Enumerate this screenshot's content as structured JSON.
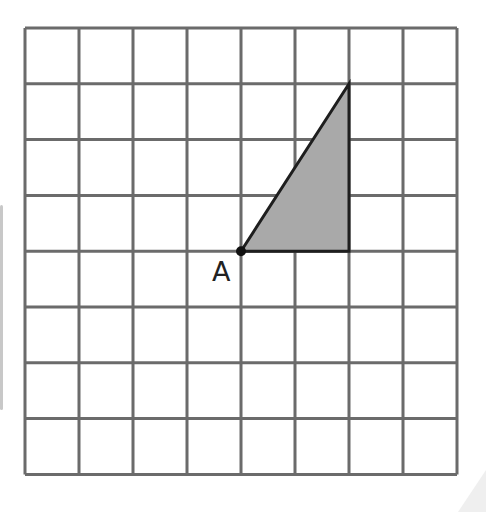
{
  "diagram": {
    "type": "grid-with-triangle",
    "grid": {
      "columns": 8,
      "rows": 8,
      "origin_px": [
        25,
        28
      ],
      "cell_width_px": 54,
      "cell_height_px": 55.8,
      "line_color": "#6b6b6b",
      "line_width": 3
    },
    "triangle": {
      "vertices_grid": [
        [
          4,
          4
        ],
        [
          6,
          1
        ],
        [
          6,
          4
        ]
      ],
      "fill": "#a9a9a9",
      "stroke": "#1e1e1e"
    },
    "point": {
      "label": "A",
      "grid": [
        4,
        4
      ],
      "color": "#111111"
    }
  }
}
